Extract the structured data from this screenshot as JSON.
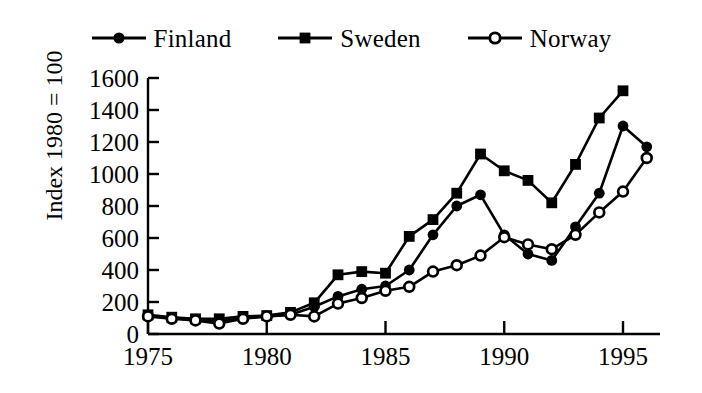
{
  "chart_data": {
    "type": "line",
    "title": "",
    "xlabel": "",
    "ylabel": "Index 1980 = 100",
    "xlim": [
      1975,
      1996
    ],
    "ylim": [
      0,
      1600
    ],
    "xticks": [
      1975,
      1980,
      1985,
      1990,
      1995
    ],
    "yticks": [
      0,
      200,
      400,
      600,
      800,
      1000,
      1200,
      1400,
      1600
    ],
    "grid": false,
    "legend_position": "top-center",
    "x": [
      1975,
      1976,
      1977,
      1978,
      1979,
      1980,
      1981,
      1982,
      1983,
      1984,
      1985,
      1986,
      1987,
      1988,
      1989,
      1990,
      1991,
      1992,
      1993,
      1994,
      1995,
      1996
    ],
    "series": [
      {
        "name": "Finland",
        "marker": "filled-circle",
        "values": [
          115,
          100,
          90,
          80,
          100,
          110,
          120,
          170,
          235,
          280,
          300,
          400,
          620,
          800,
          870,
          620,
          500,
          460,
          670,
          880,
          1300,
          1170
        ]
      },
      {
        "name": "Sweden",
        "marker": "filled-square",
        "values": [
          120,
          105,
          95,
          95,
          110,
          115,
          135,
          195,
          370,
          390,
          380,
          610,
          715,
          880,
          1125,
          1020,
          960,
          820,
          1060,
          1350,
          1520,
          null
        ]
      },
      {
        "name": "Norway",
        "marker": "open-circle",
        "values": [
          110,
          95,
          85,
          65,
          95,
          110,
          120,
          110,
          190,
          225,
          270,
          295,
          390,
          430,
          490,
          605,
          560,
          530,
          620,
          760,
          890,
          1100
        ]
      }
    ]
  },
  "legend": {
    "entries": [
      {
        "label": "Finland",
        "marker": "filled-circle-icon"
      },
      {
        "label": "Sweden",
        "marker": "filled-square-icon"
      },
      {
        "label": "Norway",
        "marker": "open-circle-icon"
      }
    ]
  },
  "axes": {
    "y_axis_title": "Index 1980 = 100",
    "y_tick_labels": [
      "1600",
      "1400",
      "1200",
      "1000",
      "800",
      "600",
      "400",
      "200",
      "0"
    ],
    "x_tick_labels": [
      "1975",
      "1980",
      "1985",
      "1990",
      "1995"
    ]
  },
  "colors": {
    "ink": "#000000",
    "background": "#ffffff"
  }
}
